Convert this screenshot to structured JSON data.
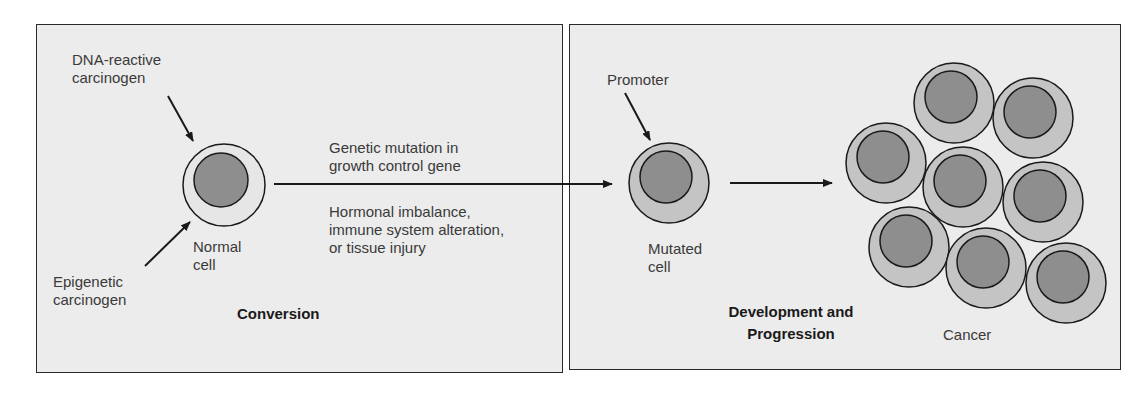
{
  "colors": {
    "panel_bg": "#ececec",
    "border": "#2a2a2a",
    "normal_cytoplasm": "#e6e6e6",
    "mutated_cytoplasm": "#c4c4c4",
    "nucleus": "#8e8e8e",
    "text": "#3a3a3a"
  },
  "panels": {
    "left": {
      "title": "Conversion",
      "dna_label": [
        "DNA-reactive",
        "carcinogen"
      ],
      "epigenetic_label": [
        "Epigenetic",
        "carcinogen"
      ],
      "normal_cell_label": [
        "Normal",
        "cell"
      ],
      "arrow_label_top": [
        "Genetic mutation in",
        "growth control gene"
      ],
      "arrow_label_bottom": [
        "Hormonal imbalance,",
        "immune system alteration,",
        "or tissue injury"
      ]
    },
    "right": {
      "title": [
        "Development and",
        "Progression"
      ],
      "promoter_label": "Promoter",
      "mutated_cell_label": [
        "Mutated",
        "cell"
      ],
      "cancer_label": "Cancer"
    }
  },
  "cells": {
    "normal": {
      "cx": 224,
      "cy": 185,
      "r": 41,
      "ncx": 221,
      "ncy": 180,
      "nr": 27
    },
    "mutated": {
      "cx": 669,
      "cy": 183,
      "r": 40,
      "ncx": 666,
      "ncy": 177,
      "nr": 26
    },
    "cancer": [
      {
        "cx": 954,
        "cy": 103
      },
      {
        "cx": 1033,
        "cy": 118
      },
      {
        "cx": 886,
        "cy": 163
      },
      {
        "cx": 963,
        "cy": 187
      },
      {
        "cx": 1043,
        "cy": 202
      },
      {
        "cx": 909,
        "cy": 247
      },
      {
        "cx": 986,
        "cy": 268
      },
      {
        "cx": 1066,
        "cy": 283
      }
    ]
  }
}
